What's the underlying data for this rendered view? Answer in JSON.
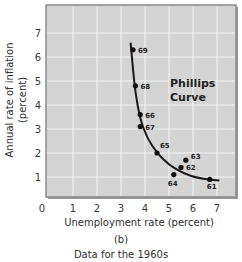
{
  "chart_data": {
    "type": "scatter",
    "title": "",
    "xlabel": "Unemployment rate (percent)",
    "ylabel": "Annual rate of inflation (percent)",
    "ylabel_lines": [
      "Annual rate of inflation",
      "(percent)"
    ],
    "xlim": [
      0,
      7.8
    ],
    "ylim": [
      0,
      8
    ],
    "x_ticks": [
      "0",
      "1",
      "2",
      "3",
      "4",
      "5",
      "6",
      "7"
    ],
    "y_ticks": [
      "1",
      "2",
      "3",
      "4",
      "5",
      "6",
      "7"
    ],
    "grid": true,
    "series": [
      {
        "name": "Data for the 1960s",
        "points": [
          {
            "label": "61",
            "x": 6.7,
            "y": 0.9
          },
          {
            "label": "62",
            "x": 5.5,
            "y": 1.4
          },
          {
            "label": "63",
            "x": 5.7,
            "y": 1.7
          },
          {
            "label": "64",
            "x": 5.2,
            "y": 1.1
          },
          {
            "label": "65",
            "x": 4.5,
            "y": 2.0
          },
          {
            "label": "66",
            "x": 3.8,
            "y": 3.6
          },
          {
            "label": "67",
            "x": 3.8,
            "y": 3.1
          },
          {
            "label": "68",
            "x": 3.6,
            "y": 4.8
          },
          {
            "label": "69",
            "x": 3.5,
            "y": 6.3
          }
        ]
      },
      {
        "name": "Phillips Curve",
        "type": "line",
        "points": [
          {
            "x": 3.4,
            "y": 6.6
          },
          {
            "x": 3.5,
            "y": 5.5
          },
          {
            "x": 3.6,
            "y": 4.5
          },
          {
            "x": 3.8,
            "y": 3.4
          },
          {
            "x": 4.1,
            "y": 2.6
          },
          {
            "x": 4.5,
            "y": 2.0
          },
          {
            "x": 5.0,
            "y": 1.5
          },
          {
            "x": 5.6,
            "y": 1.15
          },
          {
            "x": 6.2,
            "y": 0.95
          },
          {
            "x": 7.1,
            "y": 0.85
          }
        ]
      }
    ],
    "annotations": [
      {
        "text": "Phillips Curve",
        "lines": [
          "Phillips",
          "Curve"
        ],
        "x": 5.3,
        "y": 4.6
      }
    ]
  },
  "captions": {
    "panel": "(b)",
    "subtitle": "Data for the 1960s"
  },
  "colors": {
    "plot_bg": "#d4d4d4",
    "grid": "#f2f2f2",
    "frame": "#8a8a8a",
    "curve": "#1a1a1a",
    "point": "#111111"
  }
}
